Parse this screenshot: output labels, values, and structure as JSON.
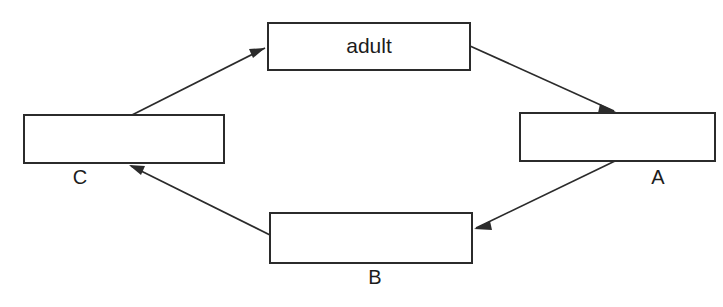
{
  "diagram": {
    "canvas": {
      "width": 723,
      "height": 307,
      "background": "#ffffff"
    },
    "stroke_color": "#2b2b2b",
    "text_color": "#1c1c1c",
    "nodes": [
      {
        "id": "adult",
        "label": "adult",
        "label_position": "inside",
        "x": 268,
        "y": 23,
        "width": 202,
        "height": 47
      },
      {
        "id": "a",
        "label": "A",
        "label_position": "below-right",
        "x": 520,
        "y": 113,
        "width": 195,
        "height": 48,
        "label_x": 658,
        "label_y": 179
      },
      {
        "id": "b",
        "label": "B",
        "label_position": "below-center",
        "x": 270,
        "y": 213,
        "width": 202,
        "height": 50,
        "label_x": 375,
        "label_y": 279
      },
      {
        "id": "c",
        "label": "C",
        "label_position": "below-left",
        "x": 24,
        "y": 115,
        "width": 200,
        "height": 48,
        "label_x": 80,
        "label_y": 179
      }
    ],
    "edges": [
      {
        "id": "c-to-adult",
        "from": "c",
        "to": "adult",
        "x1": 128,
        "y1": 117,
        "x2": 265,
        "y2": 48
      },
      {
        "id": "adult-to-a",
        "from": "adult",
        "to": "a",
        "x1": 470,
        "y1": 46,
        "x2": 614,
        "y2": 111
      },
      {
        "id": "a-to-b",
        "from": "a",
        "to": "b",
        "x1": 615,
        "y1": 161,
        "x2": 476,
        "y2": 228
      },
      {
        "id": "b-to-c",
        "from": "b",
        "to": "c",
        "x1": 270,
        "y1": 235,
        "x2": 131,
        "y2": 166
      }
    ]
  }
}
